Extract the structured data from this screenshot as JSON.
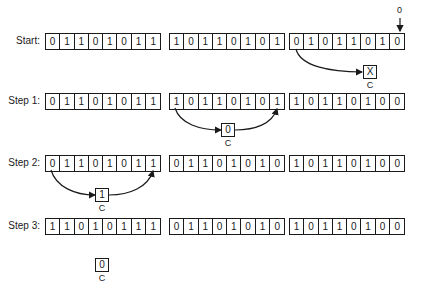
{
  "diagram": {
    "input_bit": "0",
    "carry_label": "C",
    "rows": [
      {
        "label": "Start:",
        "registers": [
          [
            "0",
            "1",
            "1",
            "0",
            "1",
            "0",
            "1",
            "1"
          ],
          [
            "1",
            "0",
            "1",
            "1",
            "0",
            "1",
            "0",
            "1"
          ],
          [
            "0",
            "1",
            "0",
            "1",
            "1",
            "0",
            "1",
            "0"
          ]
        ],
        "carry": "X"
      },
      {
        "label": "Step 1:",
        "registers": [
          [
            "0",
            "1",
            "1",
            "0",
            "1",
            "0",
            "1",
            "1"
          ],
          [
            "1",
            "0",
            "1",
            "1",
            "0",
            "1",
            "0",
            "1"
          ],
          [
            "1",
            "0",
            "1",
            "1",
            "0",
            "1",
            "0",
            "0"
          ]
        ],
        "carry": "0"
      },
      {
        "label": "Step 2:",
        "registers": [
          [
            "0",
            "1",
            "1",
            "0",
            "1",
            "0",
            "1",
            "1"
          ],
          [
            "0",
            "1",
            "1",
            "0",
            "1",
            "0",
            "1",
            "0"
          ],
          [
            "1",
            "0",
            "1",
            "1",
            "0",
            "1",
            "0",
            "0"
          ]
        ],
        "carry": "1"
      },
      {
        "label": "Step 3:",
        "registers": [
          [
            "1",
            "1",
            "0",
            "1",
            "0",
            "1",
            "1",
            "1"
          ],
          [
            "0",
            "1",
            "1",
            "0",
            "1",
            "0",
            "1",
            "0"
          ],
          [
            "1",
            "0",
            "1",
            "1",
            "0",
            "1",
            "0",
            "0"
          ]
        ],
        "carry": "0"
      }
    ]
  }
}
